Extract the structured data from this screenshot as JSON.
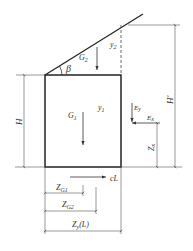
{
  "diagram": {
    "labels": {
      "G1": "G",
      "G1_sub": "1",
      "G2": "G",
      "G2_sub": "2",
      "y1": "y",
      "y1_sub": "1",
      "y2": "y",
      "y2_sub": "2",
      "beta": "β",
      "Ey": "E",
      "Ey_sub": "y",
      "Ex": "E",
      "Ex_sub": "x",
      "H": "H",
      "H_prime": "H'",
      "Zx": "Z",
      "Zx_sub": "x",
      "cL": "cL",
      "ZG1": "Z",
      "ZG1_sub": "G1",
      "ZG2": "Z",
      "ZG2_sub": "G2",
      "ZyL": "Z",
      "ZyL_sub": "y",
      "ZyL_suffix": "(L)"
    },
    "colors": {
      "line": "#333333",
      "thin_line": "#555555"
    }
  }
}
